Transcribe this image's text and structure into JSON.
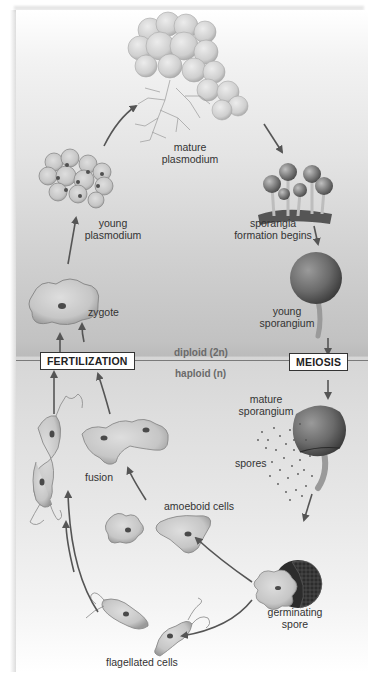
{
  "diagram": {
    "type": "life-cycle",
    "zones": {
      "upper": "diploid (2n)",
      "lower": "haploid (n)"
    },
    "stage_boxes": {
      "left": "FERTILIZATION",
      "right": "MEIOSIS"
    },
    "labels": {
      "mature_plasmodium": [
        "mature",
        "plasmodium"
      ],
      "young_plasmodium": [
        "young",
        "plasmodium"
      ],
      "sporangia_formation": [
        "sporangia",
        "formation begins"
      ],
      "young_sporangium": [
        "young",
        "sporangium"
      ],
      "zygote": "zygote",
      "mature_sporangium": [
        "mature",
        "sporangium"
      ],
      "spores": "spores",
      "fusion": "fusion",
      "amoeboid_cells": "amoeboid cells",
      "germinating_spore": [
        "germinating",
        "spore"
      ],
      "flagellated_cells": "flagellated cells"
    },
    "cycle_order": [
      "mature plasmodium",
      "sporangia formation begins",
      "young sporangium",
      "MEIOSIS",
      "mature sporangium",
      "spores",
      "germinating spore",
      "amoeboid cells / flagellated cells",
      "fusion",
      "FERTILIZATION",
      "zygote",
      "young plasmodium",
      "mature plasmodium"
    ],
    "colors": {
      "arrow": "#555555",
      "cell_fill": "#c8c8c8",
      "cell_edge": "#8a8a8a",
      "nucleus": "#555555",
      "sporangium": "#6e6e6e",
      "divider": "#7a7a7a"
    }
  }
}
